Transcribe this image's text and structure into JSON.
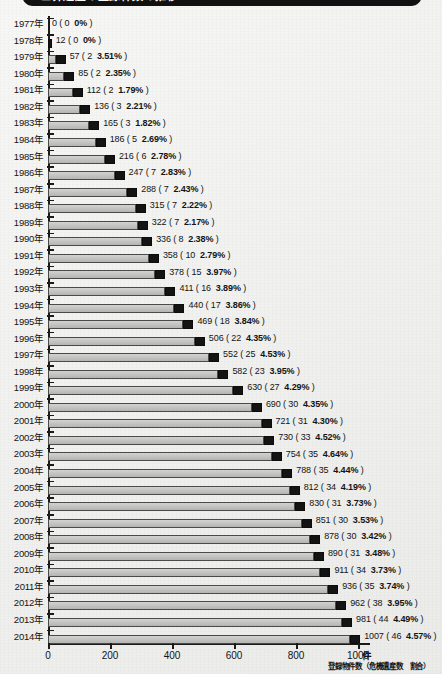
{
  "title": "世界遺産の登録件数の推移",
  "axis": {
    "unit": "件",
    "caption": "登録物件数（危機遺産数　割合）",
    "xticks": [
      "0",
      "200",
      "400",
      "600",
      "800",
      "1000"
    ],
    "xmin": 0,
    "xmax": 1000
  },
  "colors": {
    "bar_fill": "#c6c6c4",
    "bar_tip": "#141414",
    "axis": "#1a1a1a",
    "paper": "#f3f3f1",
    "banner": "#111111"
  },
  "chart_data": {
    "type": "bar",
    "orientation": "horizontal",
    "title": "世界遺産の登録件数の推移",
    "xlabel": "登録物件数（危機遺産数　割合）",
    "ylabel": "",
    "xlim": [
      0,
      1000
    ],
    "grid": false,
    "legend": null,
    "categories": [
      "1977年",
      "1978年",
      "1979年",
      "1980年",
      "1981年",
      "1982年",
      "1983年",
      "1984年",
      "1985年",
      "1986年",
      "1987年",
      "1988年",
      "1989年",
      "1990年",
      "1991年",
      "1992年",
      "1993年",
      "1994年",
      "1995年",
      "1996年",
      "1997年",
      "1998年",
      "1999年",
      "2000年",
      "2001年",
      "2002年",
      "2003年",
      "2004年",
      "2005年",
      "2006年",
      "2007年",
      "2008年",
      "2009年",
      "2010年",
      "2011年",
      "2012年",
      "2013年",
      "2014年"
    ],
    "series": [
      {
        "name": "登録物件数",
        "values": [
          0,
          12,
          57,
          85,
          112,
          136,
          165,
          186,
          216,
          247,
          288,
          315,
          322,
          336,
          358,
          378,
          411,
          440,
          469,
          506,
          552,
          582,
          630,
          690,
          721,
          730,
          754,
          788,
          812,
          830,
          851,
          878,
          890,
          911,
          936,
          962,
          981,
          1007
        ]
      },
      {
        "name": "危機遺産数",
        "values": [
          0,
          0,
          2,
          2,
          2,
          3,
          3,
          5,
          6,
          7,
          7,
          7,
          7,
          8,
          10,
          15,
          16,
          17,
          18,
          22,
          25,
          23,
          27,
          30,
          31,
          33,
          35,
          35,
          34,
          31,
          30,
          30,
          31,
          34,
          35,
          38,
          44,
          46
        ]
      },
      {
        "name": "割合",
        "values": [
          "0%",
          "0%",
          "3.51%",
          "2.35%",
          "1.79%",
          "2.21%",
          "1.82%",
          "2.69%",
          "2.78%",
          "2.83%",
          "2.43%",
          "2.22%",
          "2.17%",
          "2.38%",
          "2.79%",
          "3.97%",
          "3.89%",
          "3.86%",
          "3.84%",
          "4.35%",
          "4.53%",
          "3.95%",
          "4.29%",
          "4.35%",
          "4.30%",
          "4.52%",
          "4.64%",
          "4.44%",
          "4.19%",
          "3.73%",
          "3.53%",
          "3.42%",
          "3.48%",
          "3.73%",
          "3.74%",
          "3.95%",
          "4.49%",
          "4.57%"
        ]
      }
    ],
    "rows": [
      {
        "year": "1977年",
        "total": 0,
        "danger": 0,
        "pct": "0%",
        "label": "0 (  0　0% )"
      },
      {
        "year": "1978年",
        "total": 12,
        "danger": 0,
        "pct": "0%",
        "label": "12 (  0　0% )"
      },
      {
        "year": "1979年",
        "total": 57,
        "danger": 2,
        "pct": "3.51%",
        "label": "57 (  2　3.51% )"
      },
      {
        "year": "1980年",
        "total": 85,
        "danger": 2,
        "pct": "2.35%",
        "label": "85 (  2　2.35% )"
      },
      {
        "year": "1981年",
        "total": 112,
        "danger": 2,
        "pct": "1.79%",
        "label": "112 (  2　1.79% )"
      },
      {
        "year": "1982年",
        "total": 136,
        "danger": 3,
        "pct": "2.21%",
        "label": "136 (  3　2.21% )"
      },
      {
        "year": "1983年",
        "total": 165,
        "danger": 3,
        "pct": "1.82%",
        "label": "165 (  3　1.82% )"
      },
      {
        "year": "1984年",
        "total": 186,
        "danger": 5,
        "pct": "2.69%",
        "label": "186 (  5　2.69% )"
      },
      {
        "year": "1985年",
        "total": 216,
        "danger": 6,
        "pct": "2.78%",
        "label": "216 (  6　2.78% )"
      },
      {
        "year": "1986年",
        "total": 247,
        "danger": 7,
        "pct": "2.83%",
        "label": "247 (  7　2.83% )"
      },
      {
        "year": "1987年",
        "total": 288,
        "danger": 7,
        "pct": "2.43%",
        "label": "288 (  7　2.43% )"
      },
      {
        "year": "1988年",
        "total": 315,
        "danger": 7,
        "pct": "2.22%",
        "label": "315 (  7　2.22% )"
      },
      {
        "year": "1989年",
        "total": 322,
        "danger": 7,
        "pct": "2.17%",
        "label": "322 (  7　2.17% )"
      },
      {
        "year": "1990年",
        "total": 336,
        "danger": 8,
        "pct": "2.38%",
        "label": "336 (  8　2.38% )"
      },
      {
        "year": "1991年",
        "total": 358,
        "danger": 10,
        "pct": "2.79%",
        "label": "358 ( 10　2.79% )"
      },
      {
        "year": "1992年",
        "total": 378,
        "danger": 15,
        "pct": "3.97%",
        "label": "378 ( 15　3.97% )"
      },
      {
        "year": "1993年",
        "total": 411,
        "danger": 16,
        "pct": "3.89%",
        "label": "411 ( 16　3.89% )"
      },
      {
        "year": "1994年",
        "total": 440,
        "danger": 17,
        "pct": "3.86%",
        "label": "440 ( 17　3.86% )"
      },
      {
        "year": "1995年",
        "total": 469,
        "danger": 18,
        "pct": "3.84%",
        "label": "469 ( 18　3.84% )"
      },
      {
        "year": "1996年",
        "total": 506,
        "danger": 22,
        "pct": "4.35%",
        "label": "506 ( 22　4.35% )"
      },
      {
        "year": "1997年",
        "total": 552,
        "danger": 25,
        "pct": "4.53%",
        "label": "552 ( 25　4.53% )"
      },
      {
        "year": "1998年",
        "total": 582,
        "danger": 23,
        "pct": "3.95%",
        "label": "582 ( 23　3.95% )"
      },
      {
        "year": "1999年",
        "total": 630,
        "danger": 27,
        "pct": "4.29%",
        "label": "630 ( 27　4.29% )"
      },
      {
        "year": "2000年",
        "total": 690,
        "danger": 30,
        "pct": "4.35%",
        "label": "690 ( 30　4.35% )"
      },
      {
        "year": "2001年",
        "total": 721,
        "danger": 31,
        "pct": "4.30%",
        "label": "721 ( 31　4.30% )"
      },
      {
        "year": "2002年",
        "total": 730,
        "danger": 33,
        "pct": "4.52%",
        "label": "730 ( 33　4.52% )"
      },
      {
        "year": "2003年",
        "total": 754,
        "danger": 35,
        "pct": "4.64%",
        "label": "754 ( 35　4.64% )"
      },
      {
        "year": "2004年",
        "total": 788,
        "danger": 35,
        "pct": "4.44%",
        "label": "788 ( 35　4.44% )"
      },
      {
        "year": "2005年",
        "total": 812,
        "danger": 34,
        "pct": "4.19%",
        "label": "812 ( 34　4.19% )"
      },
      {
        "year": "2006年",
        "total": 830,
        "danger": 31,
        "pct": "3.73%",
        "label": "830 ( 31　3.73% )"
      },
      {
        "year": "2007年",
        "total": 851,
        "danger": 30,
        "pct": "3.53%",
        "label": "851 ( 30　3.53% )"
      },
      {
        "year": "2008年",
        "total": 878,
        "danger": 30,
        "pct": "3.42%",
        "label": "878 ( 30　3.42% )"
      },
      {
        "year": "2009年",
        "total": 890,
        "danger": 31,
        "pct": "3.48%",
        "label": "890 ( 31　3.48% )"
      },
      {
        "year": "2010年",
        "total": 911,
        "danger": 34,
        "pct": "3.73%",
        "label": "911 ( 34　3.73% )"
      },
      {
        "year": "2011年",
        "total": 936,
        "danger": 35,
        "pct": "3.74%",
        "label": "936 ( 35　3.74% )"
      },
      {
        "year": "2012年",
        "total": 962,
        "danger": 38,
        "pct": "3.95%",
        "label": "962 ( 38　3.95% )"
      },
      {
        "year": "2013年",
        "total": 981,
        "danger": 44,
        "pct": "4.49%",
        "label": "981 ( 44　4.49% )"
      },
      {
        "year": "2014年",
        "total": 1007,
        "danger": 46,
        "pct": "4.57%",
        "label": "1007 ( 46　4.57% )"
      }
    ]
  }
}
